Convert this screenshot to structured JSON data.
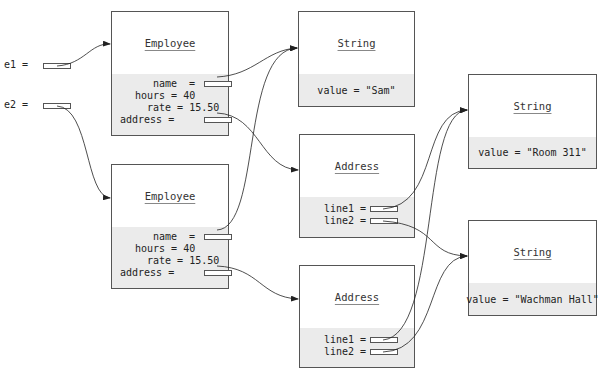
{
  "variables": [
    {
      "label": "e1 ="
    },
    {
      "label": "e2 ="
    }
  ],
  "employees": [
    {
      "class_name": "Employee",
      "name_label": "name  =",
      "hours_label": "hours = 40",
      "rate_label": "rate = 15.50",
      "address_label": "address ="
    },
    {
      "class_name": "Employee",
      "name_label": "name  =",
      "hours_label": "hours = 40",
      "rate_label": "rate = 15.50",
      "address_label": "address ="
    }
  ],
  "addresses": [
    {
      "class_name": "Address",
      "line1_label": "line1 =",
      "line2_label": "line2 ="
    },
    {
      "class_name": "Address",
      "line1_label": "line1 =",
      "line2_label": "line2 ="
    }
  ],
  "strings": [
    {
      "class_name": "String",
      "value_text": "value = \"Sam\""
    },
    {
      "class_name": "String",
      "value_text": "value = \"Room 311\""
    },
    {
      "class_name": "String",
      "value_text": "value = \"Wachman Hall\""
    }
  ],
  "colors": {
    "border": "#555555",
    "field_bg": "#ebebeb",
    "line": "#222222"
  }
}
